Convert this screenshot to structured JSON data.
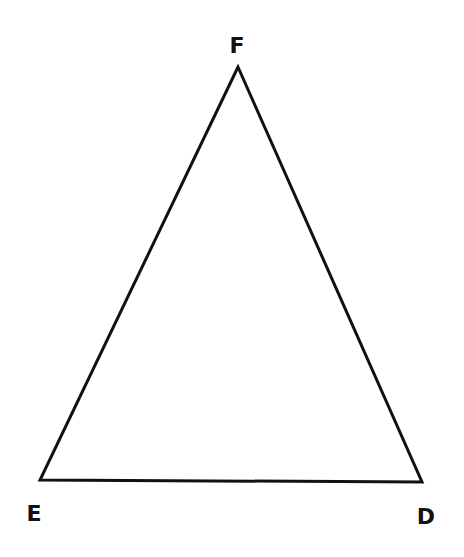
{
  "diagram": {
    "type": "triangle",
    "stroke_color": "#111111",
    "background": "#ffffff",
    "vertices": [
      {
        "name": "F",
        "label": "F",
        "x": 238,
        "y": 67,
        "label_x": 237,
        "label_y": 53
      },
      {
        "name": "E",
        "label": "E",
        "x": 40,
        "y": 480,
        "label_x": 34,
        "label_y": 521
      },
      {
        "name": "D",
        "label": "D",
        "x": 422,
        "y": 482,
        "label_x": 426,
        "label_y": 524
      }
    ],
    "edges": [
      [
        "F",
        "E"
      ],
      [
        "E",
        "D"
      ],
      [
        "D",
        "F"
      ]
    ]
  }
}
